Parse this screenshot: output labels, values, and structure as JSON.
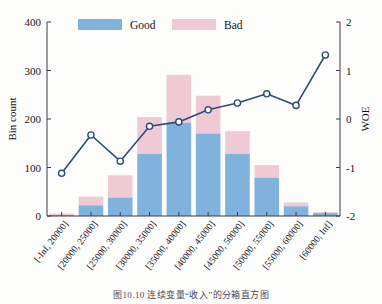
{
  "caption": "图10.10  连续变量“收入”的分箱直方图",
  "legend": {
    "good_label": "Good",
    "bad_label": "Bad",
    "good_color": "#7fb2dc",
    "bad_color": "#efcad5"
  },
  "axes": {
    "left_title": "Bin count",
    "right_title": "WOE",
    "left_ticks": [
      "0",
      "100",
      "200",
      "300",
      "400"
    ],
    "right_ticks": [
      "-2",
      "-1",
      "0",
      "1",
      "2"
    ]
  },
  "chart_data": {
    "type": "bar",
    "title": "",
    "xlabel": "",
    "ylabel": "Bin count",
    "y2label": "WOE",
    "ylim": [
      0,
      400
    ],
    "y2lim": [
      -2,
      2
    ],
    "grid": false,
    "legend_position": "top-center",
    "stacked": true,
    "categories": [
      "[-Inf, 20000]",
      "[20000, 25000]",
      "[25000, 30000]",
      "[30000, 35000]",
      "[35000, 40000]",
      "[40000, 45000]",
      "[45000, 50000]",
      "[50000, 55000]",
      "[55000, 60000]",
      "[60000, Inf]"
    ],
    "series": [
      {
        "name": "Good",
        "type": "bar",
        "color": "#7fb2dc",
        "axis": "left",
        "values": [
          2,
          22,
          38,
          128,
          192,
          170,
          128,
          79,
          20,
          6
        ]
      },
      {
        "name": "Bad",
        "type": "bar",
        "color": "#efcad5",
        "axis": "left",
        "values": [
          3,
          18,
          46,
          76,
          99,
          78,
          47,
          26,
          8,
          2
        ]
      },
      {
        "name": "WOE",
        "type": "line",
        "color": "#2e4a7d",
        "axis": "right",
        "values": [
          -1.12,
          -0.33,
          -0.87,
          -0.15,
          -0.06,
          0.19,
          0.33,
          0.52,
          0.28,
          1.32
        ]
      }
    ],
    "bin_totals": [
      5,
      40,
      84,
      204,
      291,
      248,
      175,
      105,
      28,
      8
    ]
  }
}
